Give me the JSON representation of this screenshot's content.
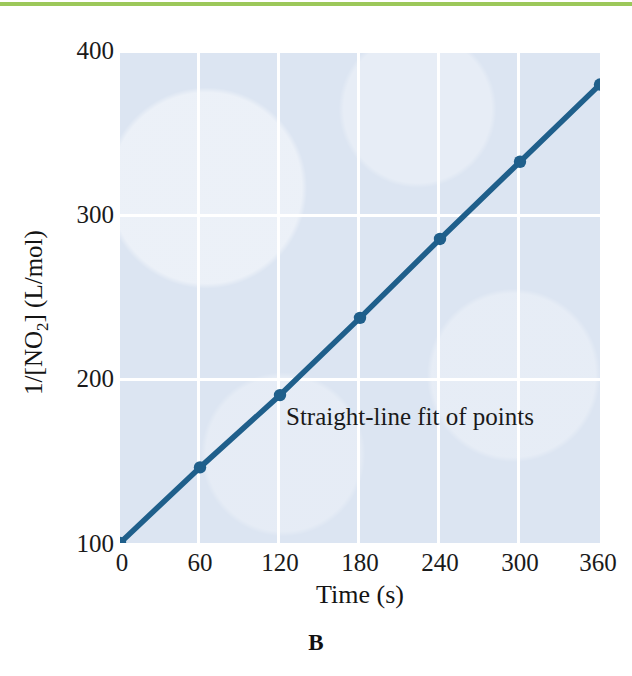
{
  "figure": {
    "panel_label": "B",
    "accent_rule_color": "#9cc85a",
    "plot_bg_color": "#dce5f2",
    "gridline_color": "#ffffff",
    "series_color": "#1f5f8b"
  },
  "annotation_text": "Straight-line fit of points",
  "chart_data": {
    "type": "line",
    "title": "",
    "subtitle": "",
    "xlabel": "Time (s)",
    "ylabel": "1/[NO2] (L/mol)",
    "ylabel_html": "1/[NO<sub>2</sub>] (L/mol)",
    "xlim": [
      0,
      360
    ],
    "ylim": [
      100,
      400
    ],
    "xticks": [
      0,
      60,
      120,
      180,
      240,
      300,
      360
    ],
    "xtick_labels": [
      "0",
      "60",
      "120",
      "180",
      "240",
      "300",
      "360"
    ],
    "yticks": [
      100,
      200,
      300,
      400
    ],
    "ytick_labels": [
      "100",
      "200",
      "300",
      "400"
    ],
    "grid": true,
    "grid_orientation": "both",
    "legend": false,
    "legend_position": "none",
    "annotations": [
      {
        "text": "Straight-line fit of points",
        "x": 195,
        "y": 182
      }
    ],
    "x": [
      0,
      60,
      120,
      180,
      240,
      300,
      360
    ],
    "series": [
      {
        "name": "1/[NO2]",
        "marker": "circle",
        "line_style": "solid",
        "color": "#1f5f8b",
        "values": [
          100,
          146,
          190,
          237,
          285,
          332,
          379
        ]
      }
    ]
  }
}
